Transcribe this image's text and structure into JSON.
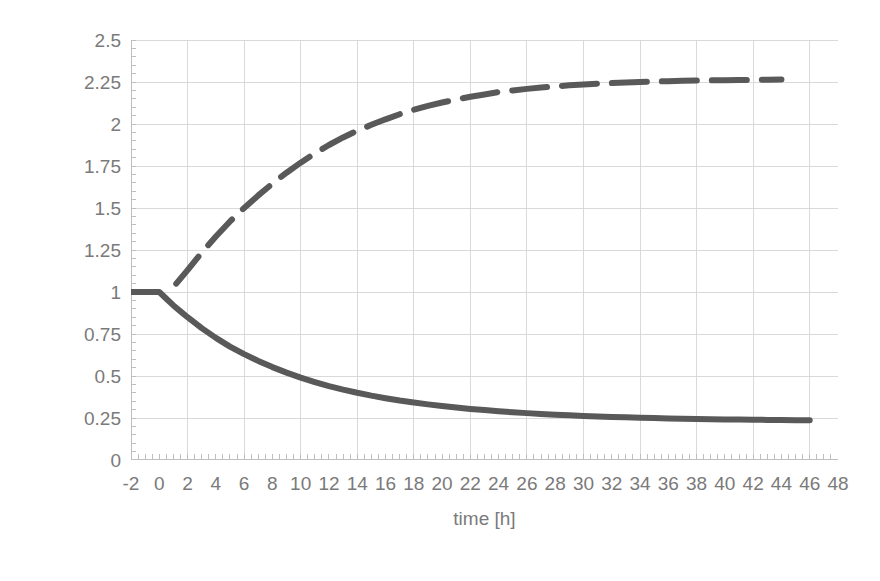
{
  "chart_data": {
    "type": "line",
    "title": "",
    "xlabel": "time [h]",
    "ylabel": "Normalized Mooney viscosity",
    "xlim": [
      -2,
      48
    ],
    "ylim": [
      0,
      2.5
    ],
    "grid": true,
    "legend": "none",
    "background": "#ffffff",
    "line_color": "#595959",
    "grid_color": "#d9d9d9",
    "axis_color": "#bfbfbf",
    "tick_label_color": "#7a7a7a",
    "x_ticks": [
      -2,
      0,
      2,
      4,
      6,
      8,
      10,
      12,
      14,
      16,
      18,
      20,
      22,
      24,
      26,
      28,
      30,
      32,
      34,
      36,
      38,
      40,
      42,
      44,
      46,
      48
    ],
    "y_ticks": [
      0,
      0.25,
      0.5,
      0.75,
      1,
      1.25,
      1.5,
      1.75,
      2,
      2.25,
      2.5
    ],
    "y_tick_labels": [
      "0",
      "0.25",
      "0.5",
      "0.75",
      "1",
      "1.25",
      "1.5",
      "1.75",
      "2",
      "2.25",
      "2.5"
    ],
    "x_minor_tick_step": 0.5,
    "y_minor_tick_step": 0.05,
    "series": [
      {
        "name": "decreasing",
        "style": "solid",
        "color": "#595959",
        "width": 6,
        "x": [
          -2,
          -1.5,
          -1,
          -0.5,
          0,
          0.5,
          1,
          1.5,
          2,
          3,
          4,
          5,
          6,
          7,
          8,
          9,
          10,
          11,
          12,
          13,
          14,
          15,
          16,
          17,
          18,
          19,
          20,
          21,
          22,
          23,
          24,
          25,
          26,
          27,
          28,
          29,
          30,
          31,
          32,
          33,
          34,
          35,
          36,
          37,
          38,
          39,
          40,
          41,
          42,
          43,
          44,
          45,
          46
        ],
        "y": [
          1.0,
          1.0,
          1.0,
          1.0,
          1.0,
          0.96,
          0.92,
          0.885,
          0.85,
          0.785,
          0.727,
          0.675,
          0.63,
          0.59,
          0.553,
          0.52,
          0.49,
          0.464,
          0.44,
          0.419,
          0.4,
          0.383,
          0.368,
          0.354,
          0.342,
          0.331,
          0.321,
          0.312,
          0.304,
          0.297,
          0.29,
          0.284,
          0.279,
          0.274,
          0.27,
          0.266,
          0.2625,
          0.2595,
          0.2565,
          0.254,
          0.2515,
          0.2495,
          0.2475,
          0.2458,
          0.2443,
          0.2429,
          0.2417,
          0.2406,
          0.2396,
          0.2387,
          0.2379,
          0.2372,
          0.2365
        ]
      },
      {
        "name": "increasing",
        "style": "dashed",
        "color": "#595959",
        "width": 6,
        "dash_pattern": "35 15",
        "x": [
          1.2,
          2,
          3,
          4,
          5,
          6,
          7,
          8,
          9,
          10,
          11,
          12,
          13,
          14,
          15,
          16,
          17,
          18,
          19,
          20,
          21,
          22,
          23,
          24,
          25,
          26,
          27,
          28,
          29,
          30,
          31,
          32,
          33,
          34,
          35,
          36,
          37,
          38,
          39,
          40,
          41,
          42,
          43,
          44
        ],
        "y": [
          1.05,
          1.13,
          1.235,
          1.33,
          1.42,
          1.5,
          1.575,
          1.645,
          1.71,
          1.77,
          1.825,
          1.875,
          1.92,
          1.96,
          1.995,
          2.028,
          2.058,
          2.085,
          2.108,
          2.128,
          2.146,
          2.162,
          2.176,
          2.19,
          2.2,
          2.209,
          2.217,
          2.224,
          2.23,
          2.235,
          2.24,
          2.244,
          2.2475,
          2.2505,
          2.253,
          2.2552,
          2.257,
          2.2585,
          2.2598,
          2.261,
          2.262,
          2.263,
          2.2638,
          2.2645
        ]
      }
    ]
  }
}
